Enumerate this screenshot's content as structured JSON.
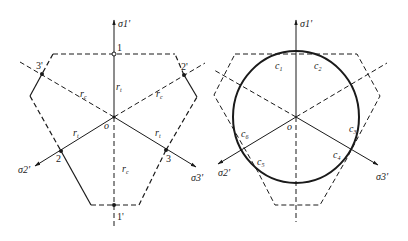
{
  "figure_left": {
    "axis_labels": {
      "sigma1": "σ1'",
      "sigma2": "σ2'",
      "sigma3": "σ3'"
    },
    "origin_label": "o",
    "points": {
      "p1": "1",
      "p1p": "1'",
      "p2": "2",
      "p2p": "2'",
      "p3": "3",
      "p3p": "3'"
    },
    "radius_labels": {
      "rt": "r",
      "rt_sub": "t",
      "rc": "r",
      "rc_sub": "c"
    }
  },
  "figure_right": {
    "axis_labels": {
      "sigma1": "σ1'",
      "sigma2": "σ2'",
      "sigma3": "σ3'"
    },
    "origin_label": "o",
    "contact_labels": [
      "c",
      "c",
      "c",
      "c",
      "c",
      "c"
    ],
    "contact_subs": [
      "1",
      "2",
      "3",
      "4",
      "5",
      "6"
    ]
  },
  "colors": {
    "line": "#1a1a1a",
    "background": "#ffffff"
  }
}
